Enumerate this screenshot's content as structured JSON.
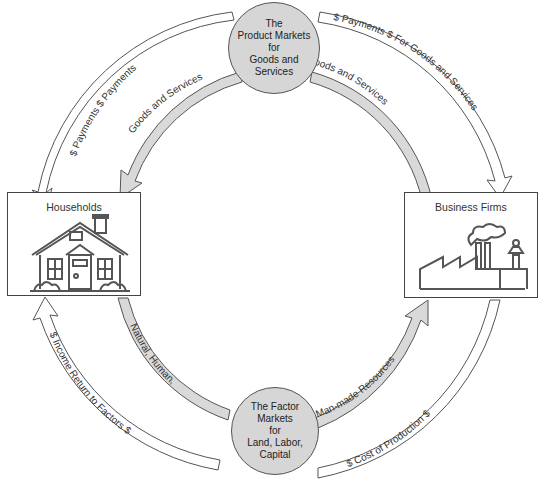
{
  "diagram": {
    "nodes": {
      "product_market": {
        "lines": [
          "The",
          "Product Markets",
          "for",
          "Goods and",
          "Services"
        ]
      },
      "factor_market": {
        "lines": [
          "The Factor",
          "Markets",
          "for",
          "Land, Labor,",
          "Capital"
        ]
      },
      "households": {
        "label": "Households",
        "icon": "house-icon"
      },
      "business_firms": {
        "label": "Business Firms",
        "icon": "factory-icon"
      }
    },
    "flows": {
      "outer_top_left": "$ Payments   $ Payments",
      "outer_top_right": "$ Payments   $ For Goods and Services",
      "inner_top_left": "Goods and Services",
      "inner_top_right": "Goods and Services",
      "inner_bottom_left": "Natural, Human,",
      "inner_bottom_right": "Man-made Resources",
      "outer_bottom_left": "$ Income   Return to Factors $",
      "outer_bottom_right": "$ Cost of Production $"
    },
    "colors": {
      "real_flow_fill": "#d9d9d9",
      "money_flow_fill": "#ffffff",
      "stroke": "#555555",
      "market_fill": "#d6d6d6"
    }
  }
}
